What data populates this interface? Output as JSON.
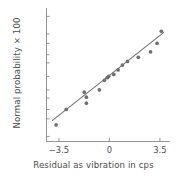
{
  "chart_data": {
    "type": "scatter",
    "title": "",
    "xlabel": "Residual as vibration in cps",
    "ylabel": "Normal probability × 100",
    "grid": false,
    "legend": null,
    "xlim": [
      -4.4,
      4.2
    ],
    "xticks": [
      -3.5,
      0,
      3.5
    ],
    "xticklabels": [
      "−3.5",
      "0",
      "3.5"
    ],
    "yscale": "normal-probability",
    "yticks": [
      1,
      5,
      10,
      20,
      30,
      50,
      70,
      80,
      90,
      95,
      99
    ],
    "yticklabels": [
      "1",
      "5",
      "10",
      "20",
      "30",
      "50",
      "70",
      "80",
      "90",
      "95",
      "99"
    ],
    "ylim": [
      0.55,
      99.6
    ],
    "point_color": "#6e6e75",
    "line_color": "#6e6e75",
    "axis_color": "#8a8a8a",
    "text_color": "#4f4f4f",
    "points": [
      {
        "x": -3.7,
        "y": 3
      },
      {
        "x": -3.0,
        "y": 10
      },
      {
        "x": -1.75,
        "y": 27
      },
      {
        "x": -1.6,
        "y": 21
      },
      {
        "x": -1.6,
        "y": 15
      },
      {
        "x": -0.7,
        "y": 30
      },
      {
        "x": -0.35,
        "y": 44
      },
      {
        "x": -0.15,
        "y": 48
      },
      {
        "x": -0.05,
        "y": 50
      },
      {
        "x": 0.3,
        "y": 53
      },
      {
        "x": 0.6,
        "y": 60
      },
      {
        "x": 0.9,
        "y": 67
      },
      {
        "x": 1.25,
        "y": 72
      },
      {
        "x": 2.0,
        "y": 77
      },
      {
        "x": 2.85,
        "y": 83
      },
      {
        "x": 3.3,
        "y": 90
      },
      {
        "x": 3.6,
        "y": 96
      }
    ],
    "fit_line": {
      "x_start": -3.95,
      "y_start": 4.4,
      "x_end": 3.75,
      "y_end": 95.5
    }
  }
}
